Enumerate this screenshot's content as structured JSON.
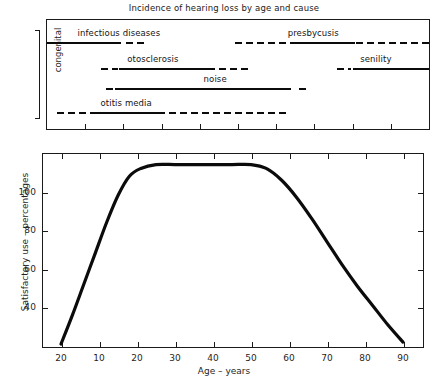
{
  "figure": {
    "title": "Incidence of hearing loss by age and cause"
  },
  "top_chart": {
    "y_axis_label": "congenital",
    "rows": [
      {
        "label": "infectious diseases"
      },
      {
        "label": "presbycusis"
      },
      {
        "label": "otosclerosis"
      },
      {
        "label": "senility"
      },
      {
        "label": "noise"
      },
      {
        "label": "otitis media"
      }
    ]
  },
  "bottom_chart": {
    "y_axis_label": "Satisfactory use – percentages",
    "x_axis_label": "Age – years",
    "y_ticks": [
      "40",
      "60",
      "80",
      "100"
    ],
    "x_ticks": [
      "20",
      "10",
      "20",
      "30",
      "40",
      "50",
      "60",
      "70",
      "80",
      "90"
    ]
  },
  "chart_data": [
    {
      "type": "bar",
      "name": "incidence-of-hearing-loss-by-age-and-cause",
      "title": "Incidence of hearing loss by age and cause",
      "orientation": "horizontal",
      "xlabel": "",
      "ylabel": "congenital",
      "grid": false,
      "legend": "none",
      "note": "Horizontal timeline bands; solid segments = peak incidence, dashed segments = lesser/uncertain incidence. X axis is age, unlabelled, with 9 inward tick marks matching the lower plot's age scale.",
      "xlim": [
        0,
        90
      ],
      "tick_count": 9,
      "categories": [
        "infectious diseases",
        "presbycusis",
        "otosclerosis",
        "senility",
        "noise",
        "otitis media"
      ],
      "bands": [
        {
          "label": "infectious diseases",
          "row": 1,
          "label_x_pct": 8,
          "segments": [
            {
              "style": "solid",
              "start_pct": 0.0,
              "end_pct": 19.3
            },
            {
              "style": "dashed",
              "start_pct": 20.8,
              "end_pct": 25.8
            }
          ]
        },
        {
          "label": "presbycusis",
          "row": 1,
          "label_x_pct": 63,
          "segments": [
            {
              "style": "dashed",
              "start_pct": 49.2,
              "end_pct": 64.8
            },
            {
              "style": "solid",
              "start_pct": 64.8,
              "end_pct": 80.5
            },
            {
              "style": "dashed",
              "start_pct": 81.0,
              "end_pct": 100.0
            }
          ]
        },
        {
          "label": "otosclerosis",
          "row": 2,
          "label_x_pct": 21,
          "segments": [
            {
              "style": "dashed",
              "start_pct": 14.1,
              "end_pct": 18.5
            },
            {
              "style": "solid",
              "start_pct": 18.8,
              "end_pct": 44.0
            },
            {
              "style": "dashed",
              "start_pct": 45.0,
              "end_pct": 53.5
            }
          ]
        },
        {
          "label": "senility",
          "row": 2,
          "label_x_pct": 82,
          "segments": [
            {
              "style": "dashed",
              "start_pct": 75.8,
              "end_pct": 79.5
            },
            {
              "style": "solid",
              "start_pct": 80.0,
              "end_pct": 100.0
            }
          ]
        },
        {
          "label": "noise",
          "row": 3,
          "label_x_pct": 41,
          "segments": [
            {
              "style": "dashed",
              "start_pct": 15.4,
              "end_pct": 17.2
            },
            {
              "style": "solid",
              "start_pct": 17.8,
              "end_pct": 64.0
            },
            {
              "style": "dashed",
              "start_pct": 66.0,
              "end_pct": 68.2
            }
          ]
        },
        {
          "label": "otitis media",
          "row": 4,
          "label_x_pct": 14,
          "segments": [
            {
              "style": "dashed",
              "start_pct": 2.6,
              "end_pct": 10.9
            },
            {
              "style": "solid",
              "start_pct": 11.2,
              "end_pct": 31.0
            },
            {
              "style": "dashed",
              "start_pct": 32.0,
              "end_pct": 63.5
            }
          ]
        }
      ]
    },
    {
      "type": "line",
      "name": "satisfactory-use-vs-age",
      "title": "",
      "xlabel": "Age – years",
      "ylabel": "Satisfactory use – percentages",
      "grid": false,
      "legend": "none",
      "xlim": [
        0,
        90
      ],
      "ylim": [
        20,
        120
      ],
      "x_tick_labels": [
        "20",
        "10",
        "20",
        "30",
        "40",
        "50",
        "60",
        "70",
        "80",
        "90"
      ],
      "y_tick_labels": [
        "40",
        "60",
        "80",
        "100"
      ],
      "y_tick_values": [
        40,
        60,
        80,
        100
      ],
      "series": [
        {
          "name": "satisfactory use",
          "x": [
            0,
            3,
            6,
            9,
            12,
            15,
            18,
            21,
            25,
            30,
            35,
            40,
            45,
            50,
            54,
            58,
            62,
            66,
            70,
            74,
            78,
            82,
            86,
            90
          ],
          "y": [
            21,
            36,
            52,
            68,
            84,
            98,
            108,
            112,
            114,
            114,
            114,
            114,
            114,
            114,
            112,
            106,
            97,
            86,
            74,
            62,
            51,
            41,
            31,
            22
          ]
        }
      ]
    }
  ]
}
